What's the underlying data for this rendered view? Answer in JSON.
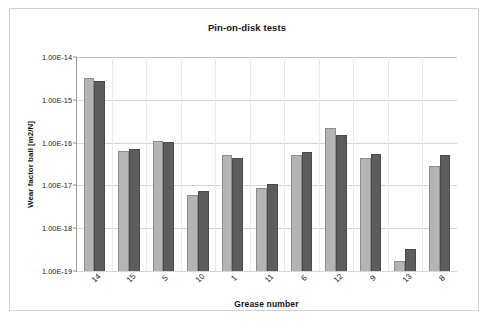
{
  "figure": {
    "background_color": "#ffffff",
    "frame_color": "#d0d0d0"
  },
  "chart_data": {
    "type": "bar",
    "title": "Pin-on-disk tests",
    "xlabel": "Grease number",
    "ylabel": "Wear factor ball [m2/N]",
    "yscale": "log",
    "ylim": [
      1e-19,
      1e-14
    ],
    "ytick_labels": [
      "1.00E-14",
      "1.00E-15",
      "1.00E-16",
      "1.00E-17",
      "1.00E-18",
      "1.00E-19"
    ],
    "ytick_values": [
      1e-14,
      1e-15,
      1e-16,
      1e-17,
      1e-18,
      1e-19
    ],
    "grid": true,
    "legend": false,
    "categories": [
      "14",
      "15",
      "5",
      "10",
      "1",
      "11",
      "6",
      "12",
      "9",
      "13",
      "8"
    ],
    "series": [
      {
        "name": "series-1",
        "color": "#b4b4b4",
        "values": [
          3.2e-15,
          6.5e-17,
          1.1e-16,
          6e-18,
          5.2e-17,
          8.5e-18,
          5e-17,
          2.2e-16,
          4.3e-17,
          1.7e-19,
          2.8e-17
        ]
      },
      {
        "name": "series-2",
        "color": "#5d5d5d",
        "values": [
          2.8e-15,
          7e-17,
          1.02e-16,
          7.5e-18,
          4.4e-17,
          1.1e-17,
          6e-17,
          1.5e-16,
          5.5e-17,
          3.3e-19,
          5e-17
        ]
      }
    ]
  }
}
